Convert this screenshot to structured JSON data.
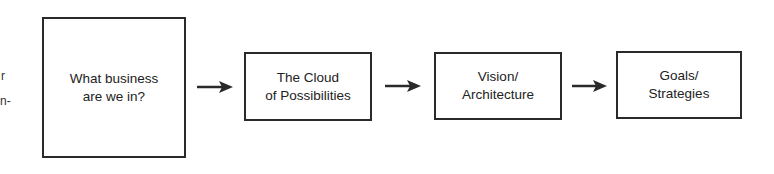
{
  "left_fragments": [
    {
      "text": "r",
      "x": 1,
      "y": 69
    },
    {
      "text": "n-",
      "x": 0,
      "y": 94
    }
  ],
  "diagram": {
    "type": "flowchart",
    "direction": "left-to-right",
    "line_color": "#2a2a2a",
    "nodes": [
      {
        "id": "business",
        "label": "What business\nare we in?",
        "x": 42,
        "y": 17,
        "w": 144,
        "h": 141
      },
      {
        "id": "cloud",
        "label": "The Cloud\nof Possibilities",
        "x": 244,
        "y": 52,
        "w": 128,
        "h": 69
      },
      {
        "id": "vision",
        "label": "Vision/\nArchitecture",
        "x": 434,
        "y": 52,
        "w": 128,
        "h": 68
      },
      {
        "id": "goals",
        "label": "Goals/\nStrategies",
        "x": 616,
        "y": 51,
        "w": 126,
        "h": 68
      }
    ],
    "edges": [
      {
        "from": "business",
        "to": "cloud",
        "x1": 197,
        "x2": 233,
        "y": 87
      },
      {
        "from": "cloud",
        "to": "vision",
        "x1": 385,
        "x2": 421,
        "y": 86
      },
      {
        "from": "vision",
        "to": "goals",
        "x1": 572,
        "x2": 607,
        "y": 86
      }
    ]
  }
}
